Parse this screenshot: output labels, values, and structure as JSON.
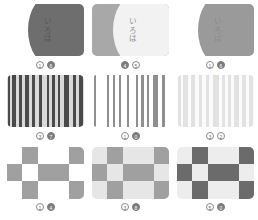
{
  "layout": {
    "rows": 3,
    "columns": 3,
    "background": "#ffffff"
  },
  "palette": {
    "white": "#ffffff",
    "off_white": "#fafafa",
    "very_light_gray": "#ededed",
    "light_gray": "#d7d7d7",
    "mid_gray": "#a8a8a8",
    "gray": "#8f8f8f",
    "dark_gray": "#6e6e6e",
    "charcoal": "#585858",
    "badge_outline_stroke": "#8a8a8a",
    "badge_fill": "#7c7c7c"
  },
  "thumbnails": [
    {
      "id": "thumb-1-1",
      "kind": "curved-card",
      "text": "いろは",
      "background": "#ffffff",
      "shape_color": "#6e6e6e",
      "text_color": "#555555",
      "badges": [
        {
          "style": "outline",
          "value": "1"
        },
        {
          "style": "filled",
          "value": "6"
        }
      ]
    },
    {
      "id": "thumb-1-2",
      "kind": "curved-card",
      "text": "いろは",
      "background": "#a8a8a8",
      "shape_color": "#f2f2f2",
      "text_color": "#8f8f8f",
      "badges": [
        {
          "style": "filled",
          "value": "4"
        },
        {
          "style": "outline",
          "value": "5"
        }
      ]
    },
    {
      "id": "thumb-1-3",
      "kind": "curved-card",
      "text": "いろは",
      "background": "#ffffff",
      "shape_color": "#9a9a9a",
      "text_color": "#8a8a8a",
      "badges": [
        {
          "style": "outline",
          "value": "1"
        },
        {
          "style": "filled",
          "value": "6"
        }
      ]
    },
    {
      "id": "thumb-2-1",
      "kind": "stripes",
      "background": "#d9d9d9",
      "bar_color": "#4a4a4a",
      "bars": [
        {
          "left": 1,
          "width": 3
        },
        {
          "left": 7,
          "width": 5
        },
        {
          "left": 16,
          "width": 3
        },
        {
          "left": 24,
          "width": 4
        },
        {
          "left": 33,
          "width": 3
        },
        {
          "left": 41,
          "width": 4
        },
        {
          "left": 52,
          "width": 3
        },
        {
          "left": 59,
          "width": 3
        },
        {
          "left": 66,
          "width": 3
        },
        {
          "left": 74,
          "width": 7
        },
        {
          "left": 86,
          "width": 4
        },
        {
          "left": 93,
          "width": 6
        }
      ],
      "badges": [
        {
          "style": "outline",
          "value": "3"
        },
        {
          "style": "filled",
          "value": "7"
        }
      ]
    },
    {
      "id": "thumb-2-2",
      "kind": "stripes",
      "background": "#ffffff",
      "bar_color": "#8f8f8f",
      "bars": [
        {
          "left": 2,
          "width": 3
        },
        {
          "left": 19,
          "width": 3
        },
        {
          "left": 27,
          "width": 3
        },
        {
          "left": 35,
          "width": 3
        },
        {
          "left": 45,
          "width": 3
        },
        {
          "left": 57,
          "width": 3
        },
        {
          "left": 64,
          "width": 3
        },
        {
          "left": 71,
          "width": 3
        },
        {
          "left": 79,
          "width": 7
        },
        {
          "left": 91,
          "width": 4
        }
      ],
      "badges": [
        {
          "style": "outline",
          "value": "1"
        },
        {
          "style": "filled",
          "value": "0"
        }
      ]
    },
    {
      "id": "thumb-2-3",
      "kind": "stripes",
      "background": "#fbfbfb",
      "bar_color": "#e2e2e2",
      "bars": [
        {
          "left": 1,
          "width": 4
        },
        {
          "left": 8,
          "width": 6
        },
        {
          "left": 18,
          "width": 5
        },
        {
          "left": 28,
          "width": 5
        },
        {
          "left": 38,
          "width": 4
        },
        {
          "left": 47,
          "width": 7
        },
        {
          "left": 58,
          "width": 4
        },
        {
          "left": 66,
          "width": 4
        },
        {
          "left": 74,
          "width": 6
        },
        {
          "left": 85,
          "width": 5
        },
        {
          "left": 94,
          "width": 5
        }
      ],
      "badges": [
        {
          "style": "outline",
          "value": "3"
        },
        {
          "style": "outline",
          "value": "2"
        }
      ]
    },
    {
      "id": "thumb-3-1",
      "kind": "checkerboard",
      "columns": 5,
      "rows": 3,
      "light_color": "#ffffff",
      "dark_color": "#a0a0a0",
      "pattern": [
        [
          0,
          1,
          0,
          0,
          1
        ],
        [
          1,
          0,
          1,
          1,
          0
        ],
        [
          0,
          1,
          0,
          0,
          1
        ]
      ],
      "badges": [
        {
          "style": "outline",
          "value": "1"
        },
        {
          "style": "filled",
          "value": "4"
        }
      ]
    },
    {
      "id": "thumb-3-2",
      "kind": "checkerboard",
      "columns": 5,
      "rows": 3,
      "light_color": "#e6e6e6",
      "dark_color": "#a0a0a0",
      "pattern": [
        [
          0,
          1,
          0,
          0,
          1
        ],
        [
          1,
          0,
          1,
          1,
          0
        ],
        [
          0,
          1,
          0,
          0,
          1
        ]
      ],
      "badges": [
        {
          "style": "outline",
          "value": "3"
        },
        {
          "style": "filled",
          "value": "8"
        }
      ]
    },
    {
      "id": "thumb-3-3",
      "kind": "checkerboard",
      "columns": 5,
      "rows": 3,
      "light_color": "#ededed",
      "dark_color": "#6b6b6b",
      "pattern": [
        [
          0,
          1,
          0,
          0,
          1
        ],
        [
          1,
          0,
          1,
          1,
          0
        ],
        [
          0,
          1,
          0,
          0,
          1
        ]
      ],
      "badges": [
        {
          "style": "outline",
          "value": "5"
        },
        {
          "style": "filled",
          "value": "0"
        }
      ]
    }
  ]
}
